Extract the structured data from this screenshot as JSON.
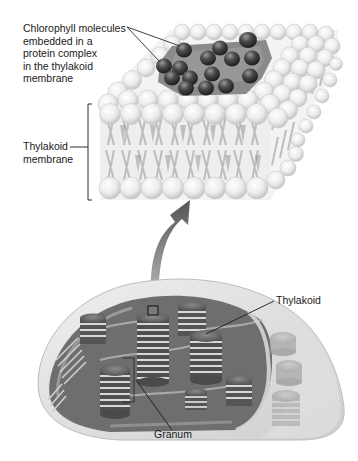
{
  "diagram": {
    "labels": {
      "chlorophyll": [
        "Chlorophyll molecules",
        "embedded in a",
        "protein complex",
        "in the thylakoid",
        "membrane"
      ],
      "thylakoid_membrane": [
        "Thylakoid",
        "membrane"
      ],
      "thylakoid": "Thylakoid",
      "granum": "Granum"
    },
    "parts": [
      {
        "id": "membrane-detail",
        "name": "Thylakoid membrane (phospholipid bilayer, magnified)"
      },
      {
        "id": "protein-complex",
        "name": "Protein complex with chlorophyll molecules"
      },
      {
        "id": "magnify-arrow",
        "name": "Curved arrow from chloroplast to membrane detail"
      },
      {
        "id": "chloroplast",
        "name": "Chloroplast cutaway"
      },
      {
        "id": "grana",
        "name": "Stacks of thylakoids (grana)"
      }
    ],
    "colors": {
      "lipid_head": "#e6e6e6",
      "protein_complex": "#7a7a7a",
      "chlorophyll": "#3f3f3f",
      "stroma": "#6c6c6c",
      "envelope": "#d9d9d9",
      "arrow": "#6b6b6b",
      "text": "#1a1a1a"
    }
  }
}
